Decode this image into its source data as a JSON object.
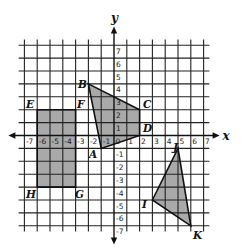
{
  "diagram": {
    "type": "coordinate-plane",
    "axes": {
      "x_label": "x",
      "y_label": "y",
      "x_range": [
        -7,
        7
      ],
      "y_range": [
        -7,
        7
      ],
      "x_ticks": [
        "-7",
        "-6",
        "-5",
        "-4",
        "-3",
        "-2",
        "-1",
        "0",
        "1",
        "2",
        "3",
        "4",
        "5",
        "6",
        "7"
      ],
      "y_ticks": [
        "-7",
        "-6",
        "-5",
        "-4",
        "-3",
        "-2",
        "-1",
        "1",
        "2",
        "3",
        "4",
        "5",
        "6",
        "7"
      ],
      "grid": true
    },
    "colors": {
      "fill": "#a9a9a9",
      "stroke": "#111111",
      "grid": "#222222"
    },
    "shapes": [
      {
        "name": "rectangle-EFGH",
        "vertices": [
          {
            "label": "E",
            "x": -6,
            "y": 2
          },
          {
            "label": "F",
            "x": -3,
            "y": 2
          },
          {
            "label": "G",
            "x": -3,
            "y": -4
          },
          {
            "label": "H",
            "x": -6,
            "y": -4
          }
        ]
      },
      {
        "name": "quadrilateral-ABCD",
        "vertices": [
          {
            "label": "A",
            "x": -1,
            "y": -1
          },
          {
            "label": "B",
            "x": -2,
            "y": 4
          },
          {
            "label": "C",
            "x": 2,
            "y": 2
          },
          {
            "label": "D",
            "x": 2,
            "y": 0
          }
        ]
      },
      {
        "name": "triangle-IJK",
        "vertices": [
          {
            "label": "I",
            "x": 3,
            "y": -5
          },
          {
            "label": "J",
            "x": 5,
            "y": -1
          },
          {
            "label": "K",
            "x": 6,
            "y": -7
          }
        ]
      }
    ],
    "vertex_labels": [
      {
        "text": "E",
        "px": 26,
        "py": 108
      },
      {
        "text": "F",
        "px": 77,
        "py": 108
      },
      {
        "text": "G",
        "px": 75,
        "py": 198
      },
      {
        "text": "H",
        "px": 26,
        "py": 198
      },
      {
        "text": "A",
        "px": 89,
        "py": 158
      },
      {
        "text": "B",
        "px": 78,
        "py": 88
      },
      {
        "text": "C",
        "px": 143,
        "py": 108
      },
      {
        "text": "D",
        "px": 143,
        "py": 132
      },
      {
        "text": "I",
        "px": 142,
        "py": 208
      },
      {
        "text": "J",
        "px": 173,
        "py": 151
      },
      {
        "text": "K",
        "px": 193,
        "py": 239
      }
    ]
  }
}
